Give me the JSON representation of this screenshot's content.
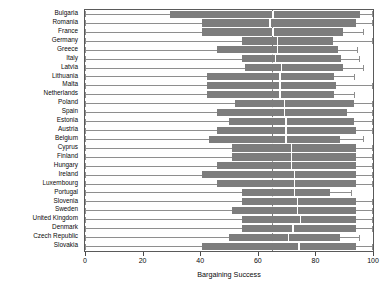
{
  "chart_data": {
    "type": "bar",
    "title": "",
    "xlabel": "Bargaining Success",
    "ylabel": "",
    "xlim": [
      0,
      100
    ],
    "xticks": [
      0,
      20,
      40,
      60,
      80,
      100
    ],
    "grid": false,
    "legend": null,
    "orientation": "horizontal",
    "reference_line": 65,
    "colors": {
      "bar": "#7d7d7d",
      "whisker": "#8e8e8e",
      "frame": "#5a5a5a",
      "reference_line": "#7a7a7a"
    },
    "categories": [
      "Bulgaria",
      "Romania",
      "France",
      "Germany",
      "Greece",
      "Italy",
      "Latvia",
      "Lithuania",
      "Malta",
      "Netherlands",
      "Poland",
      "Spain",
      "Estonia",
      "Austria",
      "Belgium",
      "Cyprus",
      "Finland",
      "Hungary",
      "Ireland",
      "Luxembourg",
      "Portugal",
      "Slovenia",
      "Sweden",
      "United Kingdom",
      "Denmark",
      "Czech Republic",
      "Slovakia"
    ],
    "values": [
      29.5,
      40.5,
      40.5,
      54.5,
      46.0,
      54.5,
      55.5,
      42.5,
      42.5,
      42.5,
      52.0,
      46.0,
      50.0,
      46.0,
      43.0,
      51.0,
      51.0,
      46.0,
      40.5,
      46.0,
      54.5,
      54.5,
      51.0,
      54.5,
      54.5,
      50.0,
      40.5
    ],
    "upper_whisker": [
      99.5,
      99.5,
      96.5,
      99.5,
      94.5,
      95.0,
      96.5,
      93.5,
      99.5,
      93.5,
      99.5,
      99.5,
      99.5,
      99.5,
      96.5,
      99.5,
      99.5,
      99.5,
      99.5,
      99.5,
      92.5,
      99.5,
      99.5,
      99.5,
      99.5,
      95.0,
      99.5
    ],
    "bar_end": [
      95.5,
      94.0,
      89.5,
      86.0,
      88.0,
      89.0,
      89.5,
      86.5,
      87.0,
      86.5,
      93.5,
      91.0,
      93.5,
      94.0,
      88.5,
      94.0,
      94.0,
      94.0,
      94.0,
      94.0,
      85.0,
      94.0,
      94.0,
      94.0,
      94.0,
      88.5,
      94.0
    ],
    "split_point": [
      65.0,
      64.0,
      65.0,
      66.5,
      66.5,
      66.0,
      68.0,
      67.5,
      67.5,
      67.5,
      69.0,
      69.0,
      69.5,
      69.5,
      69.5,
      71.5,
      71.5,
      71.5,
      72.5,
      72.5,
      72.5,
      73.5,
      73.5,
      74.5,
      72.0,
      70.5,
      74.0
    ]
  }
}
